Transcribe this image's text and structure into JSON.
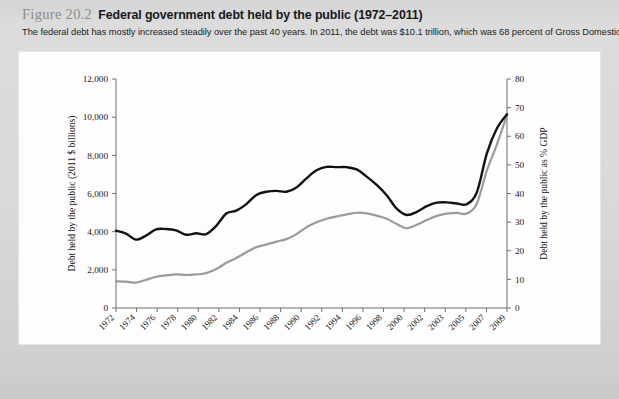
{
  "figure": {
    "label": "Figure 20.2",
    "title": "Federal government debt held by the public (1972–2011)",
    "subtitle": "The federal debt has mostly increased steadily over the past 40 years. In 2011, the debt was $10.1 trillion, which was 68 percent of Gross Domestic Product."
  },
  "chart_data": {
    "type": "line",
    "title": "Federal government debt held by the public (1972–2011)",
    "xlabel": "Year",
    "ylabel": "Debt held by the public (2011 $ billions)",
    "y2label": "Debt held by the public as % GDP",
    "grid": false,
    "legend_position": "bottom",
    "xlim": [
      1972,
      2011
    ],
    "ylim": [
      0,
      12000
    ],
    "y2lim": [
      0,
      80
    ],
    "yticks": [
      "0",
      "2,000",
      "4,000",
      "6,000",
      "8,000",
      "10,000",
      "12,000"
    ],
    "ytick_values": [
      0,
      2000,
      4000,
      6000,
      8000,
      10000,
      12000
    ],
    "y2ticks": [
      "0",
      "10",
      "20",
      "30",
      "40",
      "50",
      "60",
      "70",
      "80"
    ],
    "y2tick_values": [
      0,
      10,
      20,
      30,
      40,
      50,
      60,
      70,
      80
    ],
    "xtick_labels": [
      "1972",
      "1974",
      "1976",
      "1978",
      "1980",
      "1982",
      "1984",
      "1986",
      "1988",
      "1990",
      "1992",
      "1994",
      "1996",
      "1998",
      "2000",
      "2002",
      "2003",
      "2005",
      "2007",
      "2009"
    ],
    "x": [
      1972,
      1973,
      1974,
      1975,
      1976,
      1977,
      1978,
      1979,
      1980,
      1981,
      1982,
      1983,
      1984,
      1985,
      1986,
      1987,
      1988,
      1989,
      1990,
      1991,
      1992,
      1993,
      1994,
      1995,
      1996,
      1997,
      1998,
      1999,
      2000,
      2001,
      2002,
      2003,
      2004,
      2005,
      2006,
      2007,
      2008,
      2009,
      2010,
      2011
    ],
    "series": [
      {
        "name": "2011 $ billions",
        "color": "#9b9b9b",
        "axis": "left",
        "values": [
          1400,
          1380,
          1330,
          1480,
          1640,
          1710,
          1760,
          1730,
          1760,
          1830,
          2040,
          2370,
          2620,
          2920,
          3190,
          3330,
          3480,
          3610,
          3870,
          4230,
          4490,
          4680,
          4800,
          4900,
          4990,
          4960,
          4840,
          4680,
          4400,
          4180,
          4360,
          4610,
          4830,
          4950,
          4980,
          4950,
          5480,
          7220,
          8580,
          10100
        ]
      },
      {
        "name": "Percent of GDP",
        "color": "#121212",
        "axis": "right",
        "values": [
          27.0,
          26.0,
          23.9,
          25.3,
          27.5,
          27.6,
          27.1,
          25.6,
          26.1,
          25.8,
          28.7,
          33.0,
          34.0,
          36.3,
          39.5,
          40.6,
          40.9,
          40.6,
          42.1,
          45.3,
          48.1,
          49.3,
          49.2,
          49.2,
          48.4,
          45.9,
          43.0,
          39.4,
          34.7,
          32.5,
          33.6,
          35.6,
          36.8,
          36.9,
          36.5,
          36.3,
          40.5,
          54.1,
          62.8,
          67.7
        ]
      }
    ]
  },
  "legend": [
    {
      "label": "2011 $ billions",
      "color": "#9b9b9b"
    },
    {
      "label": "Percent of GDP",
      "color": "#121212"
    }
  ]
}
